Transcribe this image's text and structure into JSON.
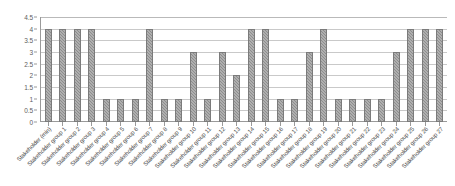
{
  "chart_data": {
    "type": "bar",
    "title": "",
    "subtitle": "",
    "xlabel": "",
    "ylabel": "",
    "ylim": [
      0,
      4.5
    ],
    "yticks": [
      "0",
      "0.5",
      "1",
      "1.5",
      "2",
      "2.5",
      "3",
      "3.5",
      "4",
      "4.5"
    ],
    "ytick_values": [
      0,
      0.5,
      1,
      1.5,
      2,
      2.5,
      3,
      3.5,
      4,
      4.5
    ],
    "grid": true,
    "legend": false,
    "legend_position": "none",
    "bar_color": "#8d8d8d",
    "categories": [
      "Stakeholder (min)",
      "Stakeholder group 1",
      "Stakeholder group 2",
      "Stakeholder group 3",
      "Stakeholder group 4",
      "Stakeholder group 5",
      "Stakeholder group 6",
      "Stakeholder group 7",
      "Stakeholder group 8",
      "Stakeholder group 9",
      "Stakeholder group 10",
      "Stakeholder group 11",
      "Stakeholder group 12",
      "Stakeholder group 13",
      "Stakeholder group 14",
      "Stakeholder group 15",
      "Stakeholder group 16",
      "Stakeholder group 17",
      "Stakeholder group 18",
      "Stakeholder group 19",
      "Stakeholder group 20",
      "Stakeholder group 21",
      "Stakeholder group 22",
      "Stakeholder group 23",
      "Stakeholder group 24",
      "Stakeholder group 25",
      "Stakeholder group 26",
      "Stakeholder group 27"
    ],
    "values": [
      4,
      4,
      4,
      4,
      1,
      1,
      1,
      4,
      1,
      1,
      3,
      1,
      3,
      2,
      4,
      4,
      1,
      1,
      3,
      4,
      1,
      1,
      1,
      1,
      3,
      4,
      4,
      4
    ]
  }
}
